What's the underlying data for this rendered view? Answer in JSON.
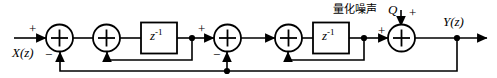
{
  "diagram": {
    "type": "block-diagram",
    "stroke_color": "#000000",
    "background": "#ffffff",
    "input": {
      "label": "X(z)",
      "sign": "+"
    },
    "output": {
      "label": "Y(z)"
    },
    "noise": {
      "label_cjk": "量化噪声",
      "symbol": "Q",
      "sign": "+",
      "meaning": "quantization noise injected at the output adder"
    },
    "delay_blocks": [
      {
        "id": "delay-1",
        "label": "z",
        "exponent": "-1"
      },
      {
        "id": "delay-2",
        "label": "z",
        "exponent": "-1"
      }
    ],
    "summers": [
      {
        "id": "summer-1",
        "glyph": "+",
        "input_signs": [
          "+",
          "-"
        ],
        "note": "X(z) plus, outer feedback minus"
      },
      {
        "id": "summer-2",
        "glyph": "+",
        "input_signs": [
          "+",
          "+"
        ],
        "note": "inner loop from first delay"
      },
      {
        "id": "summer-3",
        "glyph": "+",
        "input_signs": [
          "+",
          "-"
        ],
        "note": "outer feedback minus"
      },
      {
        "id": "summer-4",
        "glyph": "+",
        "input_signs": [
          "+",
          "+"
        ],
        "note": "inner loop from second delay"
      },
      {
        "id": "summer-5",
        "glyph": "+",
        "input_signs": [
          "+",
          "+"
        ],
        "note": "quantization noise Q added"
      }
    ],
    "signs": {
      "input_plus": "+",
      "summer1_minus": "−",
      "summer3_plus": "+",
      "summer3_minus": "−",
      "summer5_left_plus": "+",
      "summer5_top_plus": "+"
    },
    "feedback_paths": [
      {
        "id": "inner-loop-1",
        "from": "delay-1 output tap",
        "to": "summer-2 bottom"
      },
      {
        "id": "inner-loop-2",
        "from": "delay-2 output tap",
        "to": "summer-4 bottom"
      },
      {
        "id": "outer-loop",
        "from": "Y(z) tap",
        "to": "summer-1 bottom and summer-3 bottom"
      }
    ]
  }
}
